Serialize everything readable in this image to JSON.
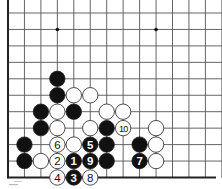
{
  "diagram": {
    "type": "go-board-fragment",
    "grid": {
      "origin_x": 8,
      "origin_y": 13,
      "spacing": 16.45,
      "cols": 13,
      "rows": 11,
      "left_edge": true,
      "bottom_edge": true,
      "line_color": "#555555",
      "edge_color": "#222222"
    },
    "star_points": [
      {
        "col": 3,
        "row": 1
      },
      {
        "col": 9,
        "row": 1
      }
    ],
    "stones": [
      {
        "color": "black",
        "col": 3,
        "row": 4
      },
      {
        "color": "black",
        "col": 3,
        "row": 5
      },
      {
        "color": "white",
        "col": 4,
        "row": 5
      },
      {
        "color": "white",
        "col": 5,
        "row": 5
      },
      {
        "color": "black",
        "col": 2,
        "row": 6
      },
      {
        "color": "white",
        "col": 3,
        "row": 6
      },
      {
        "color": "black",
        "col": 4,
        "row": 6
      },
      {
        "color": "white",
        "col": 6,
        "row": 6
      },
      {
        "color": "white",
        "col": 7,
        "row": 6
      },
      {
        "color": "black",
        "col": 2,
        "row": 7
      },
      {
        "color": "white",
        "col": 3,
        "row": 7
      },
      {
        "color": "white",
        "col": 5,
        "row": 7
      },
      {
        "color": "black",
        "col": 6,
        "row": 7
      },
      {
        "color": "white",
        "col": 7,
        "row": 7,
        "label": "10"
      },
      {
        "color": "white",
        "col": 9,
        "row": 7
      },
      {
        "color": "black",
        "col": 1,
        "row": 8
      },
      {
        "color": "white",
        "col": 3,
        "row": 8,
        "label": "6"
      },
      {
        "color": "white",
        "col": 4,
        "row": 8
      },
      {
        "color": "black",
        "col": 5,
        "row": 8,
        "label": "5"
      },
      {
        "color": "black",
        "col": 6,
        "row": 8
      },
      {
        "color": "black",
        "col": 8,
        "row": 8
      },
      {
        "color": "white",
        "col": 9,
        "row": 8
      },
      {
        "color": "black",
        "col": 1,
        "row": 9
      },
      {
        "color": "white",
        "col": 2,
        "row": 9
      },
      {
        "color": "white",
        "col": 3,
        "row": 9,
        "label": "2"
      },
      {
        "color": "black",
        "col": 4,
        "row": 9,
        "label": "1"
      },
      {
        "color": "black",
        "col": 5,
        "row": 9,
        "label": "9"
      },
      {
        "color": "black",
        "col": 6,
        "row": 9
      },
      {
        "color": "black",
        "col": 8,
        "row": 9,
        "label": "7"
      },
      {
        "color": "white",
        "col": 9,
        "row": 9
      },
      {
        "color": "white",
        "col": 3,
        "row": 10,
        "label": "4"
      },
      {
        "color": "black",
        "col": 4,
        "row": 10,
        "label": "3"
      },
      {
        "color": "white",
        "col": 5,
        "row": 10,
        "label": "8"
      }
    ],
    "colors": {
      "black_stone": "#111111",
      "white_stone": "#ffffff",
      "stone_outline": "#222222"
    }
  }
}
